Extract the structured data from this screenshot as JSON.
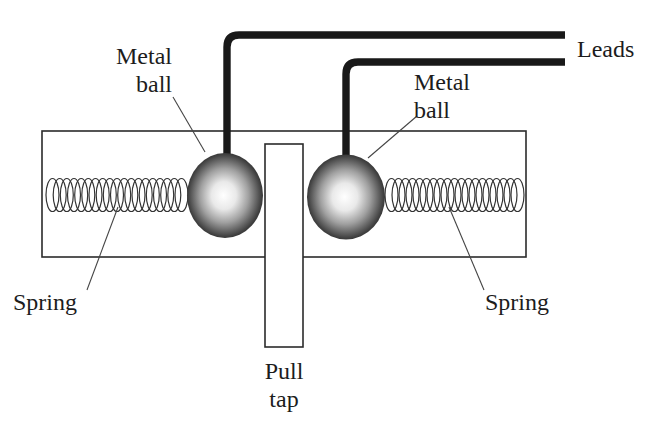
{
  "diagram": {
    "labels": {
      "metal_ball_left": {
        "line1": "Metal",
        "line2": "ball"
      },
      "metal_ball_right": {
        "line1": "Metal",
        "line2": "ball"
      },
      "leads": "Leads",
      "spring_left": "Spring",
      "spring_right": "Spring",
      "pull_tap": {
        "line1": "Pull",
        "line2": "tap"
      }
    },
    "colors": {
      "background": "#ffffff",
      "outline": "#2b2b2b",
      "wire": "#191919",
      "text": "#1c1c1c",
      "ball_edge": "#111111",
      "ball_highlight": "#ffffff"
    }
  }
}
